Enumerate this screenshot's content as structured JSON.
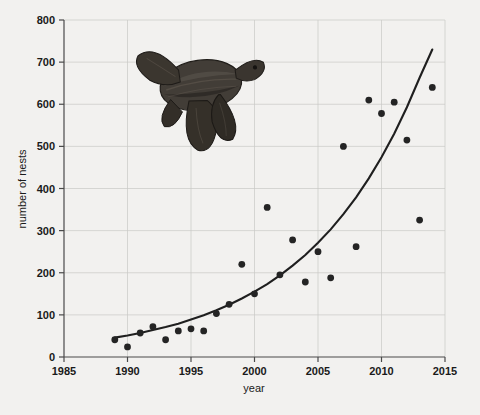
{
  "chart_data": {
    "type": "scatter",
    "title": "",
    "subtitle": "",
    "xlabel": "year",
    "ylabel": "number of nests",
    "xlim": [
      1985,
      2015
    ],
    "ylim": [
      0,
      800
    ],
    "xticks": [
      1985,
      1990,
      1995,
      2000,
      2005,
      2010,
      2015
    ],
    "yticks": [
      0,
      100,
      200,
      300,
      400,
      500,
      600,
      700,
      800
    ],
    "grid": true,
    "legend": "none",
    "annotations": [
      "leatherback-sea-turtle-illustration"
    ],
    "series": [
      {
        "name": "observed nests",
        "type": "scatter",
        "marker": "filled-circle",
        "color": "#242424",
        "points": [
          {
            "x": 1989,
            "y": 41
          },
          {
            "x": 1990,
            "y": 24
          },
          {
            "x": 1991,
            "y": 57
          },
          {
            "x": 1992,
            "y": 72
          },
          {
            "x": 1993,
            "y": 41
          },
          {
            "x": 1994,
            "y": 62
          },
          {
            "x": 1995,
            "y": 67
          },
          {
            "x": 1996,
            "y": 62
          },
          {
            "x": 1997,
            "y": 103
          },
          {
            "x": 1998,
            "y": 125
          },
          {
            "x": 1999,
            "y": 220
          },
          {
            "x": 2000,
            "y": 150
          },
          {
            "x": 2001,
            "y": 355
          },
          {
            "x": 2002,
            "y": 195
          },
          {
            "x": 2003,
            "y": 278
          },
          {
            "x": 2004,
            "y": 178
          },
          {
            "x": 2005,
            "y": 250
          },
          {
            "x": 2006,
            "y": 188
          },
          {
            "x": 2007,
            "y": 500
          },
          {
            "x": 2008,
            "y": 262
          },
          {
            "x": 2009,
            "y": 610
          },
          {
            "x": 2010,
            "y": 578
          },
          {
            "x": 2011,
            "y": 605
          },
          {
            "x": 2012,
            "y": 515
          },
          {
            "x": 2013,
            "y": 325
          },
          {
            "x": 2014,
            "y": 640
          }
        ]
      },
      {
        "name": "exponential fit",
        "type": "line",
        "color": "#1f1f1f",
        "points": [
          {
            "x": 1989,
            "y": 46
          },
          {
            "x": 1990,
            "y": 51
          },
          {
            "x": 1991,
            "y": 57
          },
          {
            "x": 1992,
            "y": 64
          },
          {
            "x": 1993,
            "y": 71
          },
          {
            "x": 1994,
            "y": 79
          },
          {
            "x": 1995,
            "y": 89
          },
          {
            "x": 1996,
            "y": 99
          },
          {
            "x": 1997,
            "y": 111
          },
          {
            "x": 1998,
            "y": 124
          },
          {
            "x": 1999,
            "y": 139
          },
          {
            "x": 2000,
            "y": 155
          },
          {
            "x": 2001,
            "y": 173
          },
          {
            "x": 2002,
            "y": 194
          },
          {
            "x": 2003,
            "y": 217
          },
          {
            "x": 2004,
            "y": 242
          },
          {
            "x": 2005,
            "y": 271
          },
          {
            "x": 2006,
            "y": 303
          },
          {
            "x": 2007,
            "y": 339
          },
          {
            "x": 2008,
            "y": 379
          },
          {
            "x": 2009,
            "y": 424
          },
          {
            "x": 2010,
            "y": 474
          },
          {
            "x": 2011,
            "y": 530
          },
          {
            "x": 2012,
            "y": 593
          },
          {
            "x": 2013,
            "y": 663
          },
          {
            "x": 2014,
            "y": 730
          }
        ]
      }
    ]
  },
  "figure": {
    "background_color": "#f2f1ef",
    "grid_color": "#c9c8c6",
    "axis_color": "#4a4a4a",
    "point_color": "#242424",
    "curve_color": "#1f1f1f"
  },
  "illustration": {
    "name": "leatherback sea turtle",
    "body_color": "#3a3733",
    "shell_color": "#4a4540",
    "flipper_color": "#2e2b27"
  }
}
